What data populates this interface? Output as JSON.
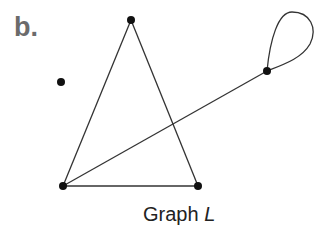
{
  "panel_label": "b.",
  "caption": {
    "prefix": "Graph ",
    "name": "L"
  },
  "graph": {
    "vertices": [
      {
        "id": "top",
        "x": 131,
        "y": 20
      },
      {
        "id": "isolated",
        "x": 61,
        "y": 82
      },
      {
        "id": "loop-vertex",
        "x": 267,
        "y": 71
      },
      {
        "id": "bottom-left",
        "x": 63,
        "y": 186
      },
      {
        "id": "bottom-right",
        "x": 198,
        "y": 186
      }
    ],
    "edges": [
      [
        "top",
        "bottom-left"
      ],
      [
        "top",
        "bottom-right"
      ],
      [
        "bottom-left",
        "bottom-right"
      ],
      [
        "bottom-left",
        "loop-vertex"
      ],
      [
        "loop-vertex",
        "loop-vertex"
      ]
    ],
    "colors": {
      "edge": "#333333",
      "vertex": "#111111"
    }
  }
}
